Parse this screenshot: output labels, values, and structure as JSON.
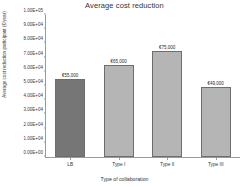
{
  "chart_data": {
    "type": "bar",
    "title": "Average cost reduction",
    "xlabel": "Type of collaboration",
    "ylabel": "Average cost reduction participant (€/year)",
    "categories": [
      "LB",
      "Type I",
      "Type II",
      "Type III"
    ],
    "values": [
      55000,
      65000,
      75000,
      49000
    ],
    "data_labels": [
      "€55,000",
      "€65,000",
      "€75,000",
      "€49,000"
    ],
    "ylim": [
      0,
      100000
    ],
    "ytick_values": [
      0,
      10000,
      20000,
      30000,
      40000,
      50000,
      60000,
      70000,
      80000,
      90000,
      100000
    ],
    "ytick_labels": [
      "0.00E+00",
      "1.00E+04",
      "2.00E+04",
      "3.00E+04",
      "4.00E+04",
      "5.00E+04",
      "6.00E+04",
      "7.00E+04",
      "8.00E+04",
      "9.00E+04",
      "1.00E+05"
    ],
    "grid": false,
    "legend": "none",
    "bar_colors": [
      "#767676",
      "#b5b5b5",
      "#b5b5b5",
      "#b5b5b5"
    ],
    "bar_border_color": "#6d6d6d",
    "axis_color": "#9a9a9a",
    "background": "#ffffff"
  }
}
